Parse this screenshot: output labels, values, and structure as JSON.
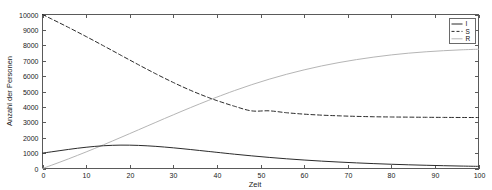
{
  "chart_data": {
    "type": "line",
    "title": "",
    "subtitle": "",
    "xlabel": "Zeit",
    "ylabel": "Anzahl der Personen",
    "xlim": [
      0,
      100
    ],
    "ylim": [
      0,
      10000
    ],
    "grid": false,
    "legend_position": "top-right",
    "legend_entries": [
      "I",
      "S",
      "R"
    ],
    "xticks": [
      0,
      10,
      20,
      30,
      40,
      50,
      60,
      70,
      80,
      90,
      100
    ],
    "xtick_labels": [
      "0",
      "10",
      "20",
      "30",
      "40",
      "50",
      "60",
      "70",
      "80",
      "90",
      "100"
    ],
    "yticks": [
      0,
      1000,
      2000,
      3000,
      4000,
      5000,
      6000,
      7000,
      8000,
      9000,
      10000
    ],
    "ytick_labels": [
      "0",
      "1000",
      "2000",
      "3000",
      "4000",
      "5000",
      "6000",
      "7000",
      "8000",
      "9000",
      "10000"
    ],
    "x": [
      0,
      2,
      4,
      6,
      8,
      10,
      12,
      14,
      16,
      18,
      20,
      22,
      24,
      26,
      28,
      30,
      32,
      34,
      36,
      38,
      40,
      44,
      48,
      52,
      56,
      60,
      64,
      68,
      72,
      76,
      80,
      84,
      88,
      92,
      96,
      100
    ],
    "series": [
      {
        "name": "I",
        "style": "solid",
        "color": "#2b2b2b",
        "width": 1.0,
        "values": [
          1000,
          1080,
          1160,
          1240,
          1315,
          1380,
          1435,
          1478,
          1505,
          1518,
          1515,
          1500,
          1473,
          1437,
          1393,
          1343,
          1288,
          1230,
          1170,
          1110,
          1050,
          930,
          820,
          720,
          630,
          550,
          480,
          418,
          364,
          317,
          276,
          240,
          209,
          182,
          159,
          139
        ]
      },
      {
        "name": "S",
        "style": "dashed",
        "color": "#2b2b2b",
        "width": 1.0,
        "values": [
          10000,
          9720,
          9440,
          9155,
          8865,
          8570,
          8270,
          7965,
          7660,
          7350,
          7045,
          6740,
          6440,
          6145,
          5860,
          5585,
          5320,
          5070,
          4835,
          4615,
          4410,
          4045,
          3740,
          3745,
          3620,
          3530,
          3465,
          3420,
          3385,
          3360,
          3345,
          3335,
          3325,
          3318,
          3313,
          3310
        ]
      },
      {
        "name": "R",
        "style": "solid",
        "color": "#b5b5b5",
        "width": 1.0,
        "values": [
          0,
          205,
          415,
          630,
          850,
          1075,
          1305,
          1540,
          1780,
          2022,
          2265,
          2510,
          2755,
          3000,
          3245,
          3485,
          3725,
          3960,
          4190,
          4415,
          4635,
          5055,
          5445,
          5800,
          6120,
          6405,
          6660,
          6880,
          7070,
          7235,
          7375,
          7490,
          7580,
          7650,
          7705,
          7745
        ]
      }
    ]
  },
  "axes": {
    "x_label": "Zeit",
    "y_label": "Anzahl der Personen"
  }
}
